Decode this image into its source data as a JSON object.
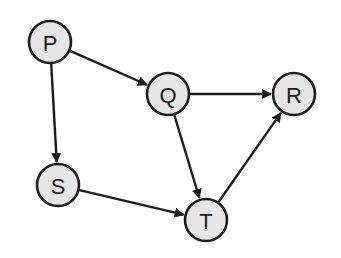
{
  "diagram": {
    "type": "directed-graph",
    "colors": {
      "node_fill": "#e6e6e6",
      "stroke": "#1c1c1c",
      "background": "#ffffff"
    },
    "node_radius": 21,
    "nodes": [
      {
        "id": "P",
        "label": "P",
        "x": 50,
        "y": 42
      },
      {
        "id": "Q",
        "label": "Q",
        "x": 168,
        "y": 94
      },
      {
        "id": "R",
        "label": "R",
        "x": 294,
        "y": 94
      },
      {
        "id": "S",
        "label": "S",
        "x": 58,
        "y": 185
      },
      {
        "id": "T",
        "label": "T",
        "x": 206,
        "y": 220
      }
    ],
    "edges": [
      {
        "from": "P",
        "to": "Q"
      },
      {
        "from": "P",
        "to": "S"
      },
      {
        "from": "Q",
        "to": "R"
      },
      {
        "from": "Q",
        "to": "T"
      },
      {
        "from": "S",
        "to": "T"
      },
      {
        "from": "T",
        "to": "R"
      }
    ]
  }
}
